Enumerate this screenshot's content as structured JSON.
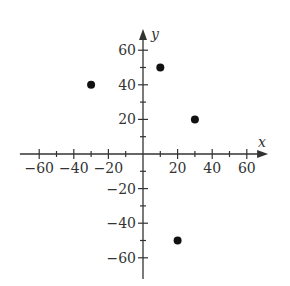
{
  "chart_data": {
    "type": "scatter",
    "title": "",
    "xlabel": "x",
    "ylabel": "y",
    "xlim": [
      -70,
      70
    ],
    "ylim": [
      -70,
      70
    ],
    "xticks": [
      -60,
      -40,
      -20,
      20,
      40,
      60
    ],
    "yticks": [
      -60,
      -40,
      -20,
      20,
      40,
      60
    ],
    "minor_tick_step": 10,
    "grid": false,
    "points": [
      {
        "x": -30,
        "y": 40
      },
      {
        "x": 10,
        "y": 50
      },
      {
        "x": 30,
        "y": 20
      },
      {
        "x": 20,
        "y": -50
      }
    ],
    "point_color": "#111111",
    "axis_color": "#333333"
  }
}
